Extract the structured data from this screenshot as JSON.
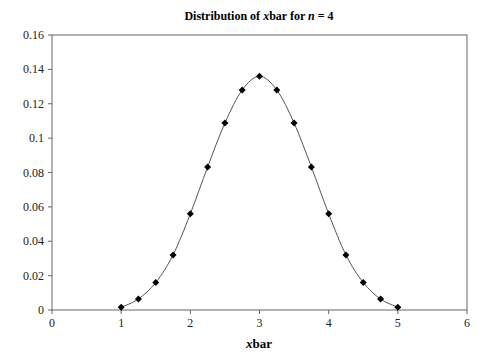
{
  "chart_data": {
    "type": "line",
    "title": "Distribution of xbar for n = 4",
    "title_parts": [
      "Distribution of ",
      "x",
      "bar for ",
      "n",
      " = 4"
    ],
    "xlabel": "xbar",
    "xlabel_parts": [
      "x",
      "bar"
    ],
    "ylabel": "",
    "xlim": [
      0,
      6
    ],
    "ylim": [
      0,
      0.16
    ],
    "xticks": [
      "0",
      "1",
      "2",
      "3",
      "4",
      "5",
      "6"
    ],
    "yticks": [
      "0",
      "0.02",
      "0.04",
      "0.06",
      "0.08",
      "0.1",
      "0.12",
      "0.14",
      "0.16"
    ],
    "grid": false,
    "legend": null,
    "marker": "diamond",
    "smooth_line": true,
    "series": [
      {
        "name": "P(xbar)",
        "x": [
          1,
          1.25,
          1.5,
          1.75,
          2,
          2.25,
          2.5,
          2.75,
          3,
          3.25,
          3.5,
          3.75,
          4,
          4.25,
          4.5,
          4.75,
          5
        ],
        "values": [
          0.0016,
          0.0064,
          0.016,
          0.032,
          0.056,
          0.0832,
          0.1088,
          0.128,
          0.136,
          0.128,
          0.1088,
          0.0832,
          0.056,
          0.032,
          0.016,
          0.0064,
          0.0016
        ]
      }
    ]
  }
}
